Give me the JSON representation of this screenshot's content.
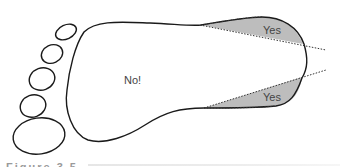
{
  "figure": {
    "type": "footprint-diagram",
    "regions": {
      "sole": {
        "label": "No!"
      },
      "heel_upper": {
        "label": "Yes"
      },
      "heel_lower": {
        "label": "Yes"
      }
    },
    "toes_count": 5,
    "colors": {
      "outline": "#1a1a1a",
      "shaded_region": "#bdbdbd",
      "dotted_line": "#333333",
      "label_text": "#444444",
      "caption_text": "#9a9a9a"
    }
  },
  "caption": {
    "text": "Figure 3.5"
  }
}
